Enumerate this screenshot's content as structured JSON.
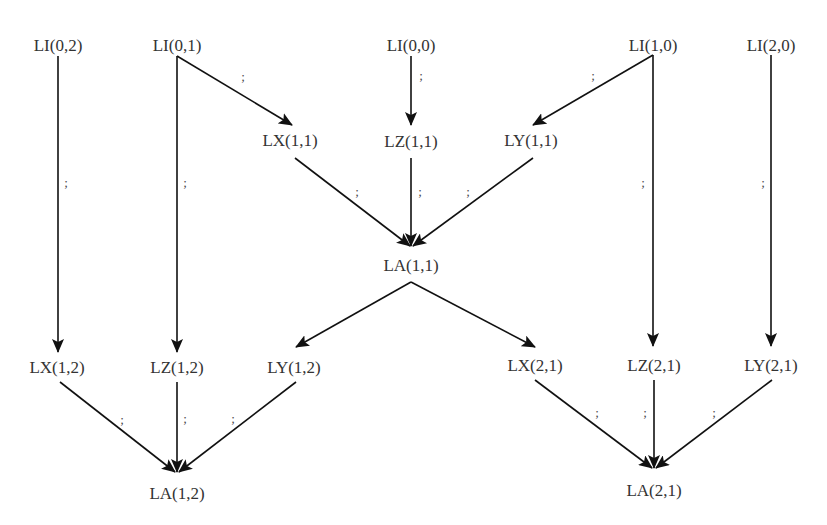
{
  "diagram": {
    "type": "dependency-graph",
    "edge_label": ";",
    "colors": {
      "edge": "#111111",
      "text": "#333333",
      "background": "#ffffff"
    },
    "nodes": [
      {
        "id": "LI02",
        "label": "LI(0,2)",
        "x": 58,
        "y": 46
      },
      {
        "id": "LI01",
        "label": "LI(0,1)",
        "x": 177,
        "y": 46
      },
      {
        "id": "LI00",
        "label": "LI(0,0)",
        "x": 411,
        "y": 46
      },
      {
        "id": "LI10",
        "label": "LI(1,0)",
        "x": 653,
        "y": 46
      },
      {
        "id": "LI20",
        "label": "LI(2,0)",
        "x": 771,
        "y": 46
      },
      {
        "id": "LX11",
        "label": "LX(1,1)",
        "x": 290,
        "y": 141
      },
      {
        "id": "LZ11",
        "label": "LZ(1,1)",
        "x": 411,
        "y": 142
      },
      {
        "id": "LY11",
        "label": "LY(1,1)",
        "x": 531,
        "y": 141
      },
      {
        "id": "LA11",
        "label": "LA(1,1)",
        "x": 411,
        "y": 266
      },
      {
        "id": "LX12",
        "label": "LX(1,2)",
        "x": 57,
        "y": 368
      },
      {
        "id": "LZ12",
        "label": "LZ(1,2)",
        "x": 177,
        "y": 368
      },
      {
        "id": "LY12",
        "label": "LY(1,2)",
        "x": 294,
        "y": 368
      },
      {
        "id": "LX21",
        "label": "LX(2,1)",
        "x": 535,
        "y": 366
      },
      {
        "id": "LZ21",
        "label": "LZ(2,1)",
        "x": 654,
        "y": 366
      },
      {
        "id": "LY21",
        "label": "LY(2,1)",
        "x": 771,
        "y": 366
      },
      {
        "id": "LA12",
        "label": "LA(1,2)",
        "x": 177,
        "y": 494
      },
      {
        "id": "LA21",
        "label": "LA(2,1)",
        "x": 654,
        "y": 491
      }
    ],
    "edges": [
      {
        "from": "LI02",
        "to": "LX12",
        "x1": 58,
        "y1": 56,
        "x2": 58,
        "y2": 352,
        "sx": 66,
        "sy": 183
      },
      {
        "from": "LI01",
        "to": "LZ12",
        "x1": 177,
        "y1": 56,
        "x2": 177,
        "y2": 352,
        "sx": 185,
        "sy": 183
      },
      {
        "from": "LI01",
        "to": "LX11",
        "x1": 177,
        "y1": 56,
        "x2": 292,
        "y2": 125,
        "sx": 243,
        "sy": 77
      },
      {
        "from": "LI00",
        "to": "LZ11",
        "x1": 411,
        "y1": 56,
        "x2": 411,
        "y2": 125,
        "sx": 421,
        "sy": 76
      },
      {
        "from": "LI10",
        "to": "LY11",
        "x1": 653,
        "y1": 55,
        "x2": 533,
        "y2": 125,
        "sx": 593,
        "sy": 76
      },
      {
        "from": "LI10",
        "to": "LZ21",
        "x1": 653,
        "y1": 55,
        "x2": 653,
        "y2": 346,
        "sx": 643,
        "sy": 183
      },
      {
        "from": "LI20",
        "to": "LY21",
        "x1": 771,
        "y1": 55,
        "x2": 771,
        "y2": 346,
        "sx": 763,
        "sy": 183
      },
      {
        "from": "LX11",
        "to": "LA11",
        "x1": 295,
        "y1": 158,
        "x2": 410,
        "y2": 246,
        "sx": 357,
        "sy": 192
      },
      {
        "from": "LZ11",
        "to": "LA11",
        "x1": 411,
        "y1": 158,
        "x2": 411,
        "y2": 246,
        "sx": 420,
        "sy": 192
      },
      {
        "from": "LY11",
        "to": "LA11",
        "x1": 533,
        "y1": 158,
        "x2": 413,
        "y2": 246,
        "sx": 468,
        "sy": 192
      },
      {
        "from": "LA11",
        "to": "LY12",
        "x1": 411,
        "y1": 282,
        "x2": 296,
        "y2": 347,
        "sx": null,
        "sy": null
      },
      {
        "from": "LA11",
        "to": "LX21",
        "x1": 411,
        "y1": 282,
        "x2": 535,
        "y2": 347,
        "sx": null,
        "sy": null
      },
      {
        "from": "LX12",
        "to": "LA12",
        "x1": 60,
        "y1": 382,
        "x2": 175,
        "y2": 472,
        "sx": 122,
        "sy": 420
      },
      {
        "from": "LZ12",
        "to": "LA12",
        "x1": 177,
        "y1": 382,
        "x2": 177,
        "y2": 472,
        "sx": 185,
        "sy": 419
      },
      {
        "from": "LY12",
        "to": "LA12",
        "x1": 296,
        "y1": 382,
        "x2": 179,
        "y2": 472,
        "sx": 233,
        "sy": 419
      },
      {
        "from": "LX21",
        "to": "LA21",
        "x1": 535,
        "y1": 380,
        "x2": 652,
        "y2": 468,
        "sx": 597,
        "sy": 413
      },
      {
        "from": "LZ21",
        "to": "LA21",
        "x1": 654,
        "y1": 380,
        "x2": 654,
        "y2": 468,
        "sx": 645,
        "sy": 413
      },
      {
        "from": "LY21",
        "to": "LA21",
        "x1": 772,
        "y1": 380,
        "x2": 656,
        "y2": 468,
        "sx": 714,
        "sy": 413
      }
    ]
  }
}
